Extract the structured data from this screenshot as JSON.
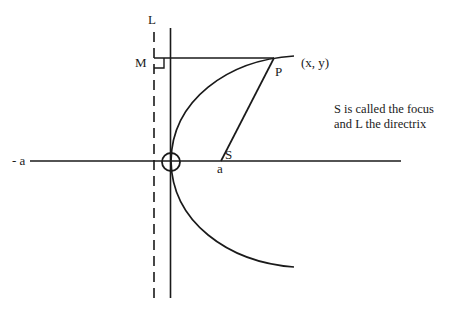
{
  "diagram": {
    "colors": {
      "stroke": "#1a1a1a",
      "background": "#ffffff"
    },
    "labels": {
      "directrix": "L",
      "foot": "M",
      "point": "P",
      "point_coords": "(x, y)",
      "focus": "S",
      "focus_x": "a",
      "neg_a": "- a"
    },
    "note": {
      "line1": "S is called the focus",
      "line2": "and L the directrix"
    }
  }
}
